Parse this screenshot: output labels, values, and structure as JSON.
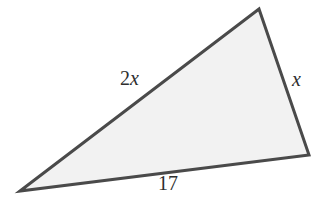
{
  "figure": {
    "kind": "triangle-diagram",
    "background_color": "#ffffff",
    "shape": {
      "name": "triangle",
      "fill_color": "#f2f2f2",
      "stroke_color": "#4a4a4a",
      "stroke_width": 3,
      "vertices": [
        {
          "name": "left-vertex",
          "x": 20,
          "y": 191
        },
        {
          "name": "top-apex-vertex",
          "x": 259,
          "y": 9
        },
        {
          "name": "right-vertex",
          "x": 309,
          "y": 155
        }
      ],
      "points_attr": "20,191 259,9 309,155"
    },
    "labels": [
      {
        "name": "side-label-2x",
        "side": "left-upper-side",
        "coefficient": "2",
        "variable": "x",
        "text": "2x"
      },
      {
        "name": "side-label-x",
        "side": "right-side",
        "coefficient": "",
        "variable": "x",
        "text": "x"
      },
      {
        "name": "side-label-17",
        "side": "bottom-side",
        "coefficient": "17",
        "variable": "",
        "text": "17"
      }
    ]
  }
}
